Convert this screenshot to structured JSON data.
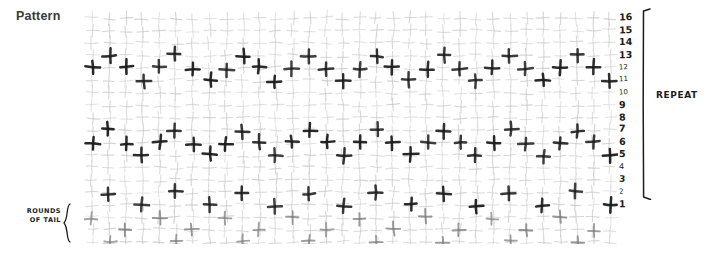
{
  "header": {
    "title": "Pattern"
  },
  "chart": {
    "repeat_label": "REPEAT",
    "tail_label_line1": "ROUNDS",
    "tail_label_line2": "OF TAIL",
    "columns": 32,
    "rows": 19,
    "cell_width": 16.7,
    "cell_height": 12.45,
    "colors": {
      "grid_stitch": "#c8c8c8",
      "dark_stitch": "#1c1c1c",
      "mid_stitch": "#7a7a7a",
      "ink": "#1c1c1c",
      "background": "#ffffff",
      "title": "#3a3a3a"
    },
    "repeat_row_numbers": [
      {
        "label": "16",
        "row": 16,
        "size": 9.5,
        "bold": true
      },
      {
        "label": "15",
        "row": 15,
        "size": 9.5,
        "bold": true
      },
      {
        "label": "14",
        "row": 14,
        "size": 9.5,
        "bold": true
      },
      {
        "label": "13",
        "row": 13,
        "size": 9.5,
        "bold": true
      },
      {
        "label": "12",
        "row": 12,
        "size": 7,
        "bold": false
      },
      {
        "label": "11",
        "row": 11,
        "size": 7,
        "bold": false
      },
      {
        "label": "10",
        "row": 10,
        "size": 7,
        "bold": false
      },
      {
        "label": "9",
        "row": 9,
        "size": 9.5,
        "bold": true
      },
      {
        "label": "8",
        "row": 8,
        "size": 9.5,
        "bold": true
      },
      {
        "label": "7",
        "row": 7,
        "size": 9.5,
        "bold": true
      },
      {
        "label": "6",
        "row": 6,
        "size": 9.5,
        "bold": true
      },
      {
        "label": "5",
        "row": 5,
        "size": 9.5,
        "bold": true
      },
      {
        "label": "4",
        "row": 4,
        "size": 8,
        "bold": false
      },
      {
        "label": "3",
        "row": 3,
        "size": 9,
        "bold": true
      },
      {
        "label": "2",
        "row": 2,
        "size": 7,
        "bold": false
      },
      {
        "label": "1",
        "row": 1,
        "size": 9.5,
        "bold": true
      }
    ],
    "tail_rows": [
      {
        "label": "40"
      },
      {
        "label": "39"
      },
      {
        "label": "38"
      }
    ]
  },
  "chart_data": {
    "type": "heatmap",
    "title": "Pattern",
    "xlabel": "",
    "ylabel": "",
    "legend": [
      "REPEAT",
      "ROUNDS OF TAIL"
    ],
    "grid": true,
    "columns": 32,
    "rows": 19,
    "row_labels": [
      "1",
      "2",
      "3",
      "4",
      "5",
      "6",
      "7",
      "8",
      "9",
      "10",
      "11",
      "12",
      "13",
      "14",
      "15",
      "16",
      "38",
      "39",
      "40"
    ],
    "dark_marks": [
      {
        "row": 13,
        "cols": [
          2,
          6,
          10,
          14,
          18,
          22,
          26,
          30
        ]
      },
      {
        "row": 12,
        "cols": [
          1,
          3,
          5,
          7,
          9,
          11,
          13,
          15,
          17,
          19,
          21,
          23,
          25,
          27,
          29,
          31
        ]
      },
      {
        "row": 11,
        "cols": [
          4,
          8,
          12,
          16,
          20,
          24,
          28,
          32
        ]
      },
      {
        "row": 7,
        "cols": [
          2,
          6,
          10,
          14,
          18,
          22,
          26,
          30
        ]
      },
      {
        "row": 6,
        "cols": [
          1,
          3,
          5,
          7,
          9,
          11,
          13,
          15,
          17,
          19,
          21,
          23,
          25,
          27,
          29,
          31
        ]
      },
      {
        "row": 5,
        "cols": [
          4,
          8,
          12,
          16,
          20,
          24,
          28,
          32
        ]
      },
      {
        "row": 2,
        "cols": [
          2,
          6,
          10,
          14,
          18,
          22,
          26,
          30
        ]
      },
      {
        "row": 1,
        "cols": [
          4,
          8,
          12,
          16,
          20,
          24,
          28,
          32
        ]
      }
    ],
    "mid_marks": [
      {
        "row": 40,
        "cols": [
          1,
          5,
          9,
          13,
          17,
          21,
          25,
          29
        ]
      },
      {
        "row": 39,
        "cols": [
          3,
          7,
          11,
          15,
          19,
          23,
          27,
          31
        ]
      },
      {
        "row": 38,
        "cols": [
          2,
          6,
          10,
          14,
          18,
          22,
          26,
          30
        ]
      }
    ]
  }
}
